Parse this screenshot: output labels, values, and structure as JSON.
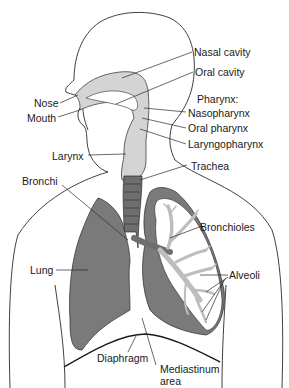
{
  "diagram": {
    "colors": {
      "outline": "#2a2a2a",
      "upper_airway_fill": "#d4d4d4",
      "lung_fill": "#7a7a7a",
      "trachea_fill": "#6e6e6e",
      "bronchiole_fill": "#cfcfcf",
      "background": "#ffffff"
    },
    "labels": {
      "nasal_cavity": "Nasal cavity",
      "oral_cavity": "Oral cavity",
      "pharynx": "Pharynx:",
      "nasopharynx": "Nasopharynx",
      "oral_pharynx": "Oral pharynx",
      "laryngopharynx": "Laryngopharynx",
      "nose": "Nose",
      "mouth": "Mouth",
      "larynx": "Larynx",
      "trachea": "Trachea",
      "bronchi": "Bronchi",
      "bronchioles": "Bronchioles",
      "lung": "Lung",
      "alveoli": "Alveoli",
      "diaphragm": "Diaphragm",
      "mediastinum_line1": "Mediastinum",
      "mediastinum_line2": "area"
    }
  }
}
